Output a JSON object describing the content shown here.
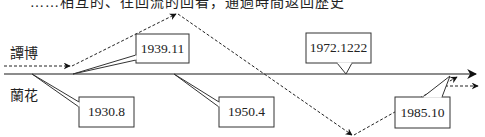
{
  "header": {
    "cropped_caption": "……相互的、往回流的回看，通過時間返回歷史"
  },
  "timelines": [
    {
      "name": "譚博",
      "style": "dashed",
      "color": "#222222"
    },
    {
      "name": "蘭花",
      "style": "solid",
      "color": "#555555"
    }
  ],
  "callouts": [
    {
      "id": "c1",
      "label": "1930.8",
      "anchor": "蘭花 line start"
    },
    {
      "id": "c2",
      "label": "1939.11",
      "anchor": "譚博 joins 蘭花"
    },
    {
      "id": "c3",
      "label": "1950.4",
      "anchor": "蘭花 line"
    },
    {
      "id": "c4",
      "label": "1972.1222",
      "anchor": "蘭花 line"
    },
    {
      "id": "c5",
      "label": "1985.10",
      "anchor": "譚博 returns"
    }
  ],
  "colors": {
    "line": "#555555",
    "dash": "#222222",
    "box_border": "#333333",
    "text": "#222222",
    "background": "#ffffff"
  }
}
